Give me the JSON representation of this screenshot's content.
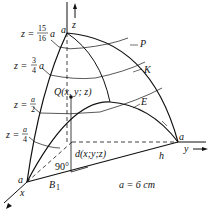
{
  "figure": {
    "axes": {
      "x": "x",
      "y": "y",
      "z": "z"
    },
    "vertices": {
      "top": "a",
      "x_end": "a",
      "y_end": "a"
    },
    "level_labels": [
      {
        "lhs": "z =",
        "num": "15",
        "den": "16",
        "suffix": "a"
      },
      {
        "lhs": "z =",
        "num": "3",
        "den": "4",
        "suffix": "a"
      },
      {
        "lhs": "z =",
        "num": "a",
        "den": "2",
        "suffix": ""
      },
      {
        "lhs": "z =",
        "num": "a",
        "den": "4",
        "suffix": ""
      }
    ],
    "curve_labels": {
      "P": "P",
      "K": "K",
      "E": "E"
    },
    "point_label": "Q(x, y; z)",
    "distance_label": "d(x;y;z)",
    "angle_label": "90°",
    "base_label": "B",
    "base_subscript": "1",
    "h_label": "h",
    "dimension": "a = 6 cm"
  }
}
